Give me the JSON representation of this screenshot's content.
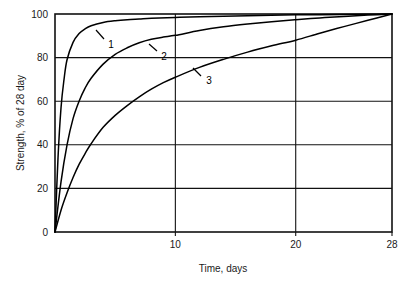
{
  "chart_data": {
    "type": "line",
    "title": "",
    "xlabel": "Time, days",
    "ylabel": "Strength, % of 28 day",
    "xlim": [
      0,
      28
    ],
    "ylim": [
      0,
      100
    ],
    "grid": true,
    "legend": "inline-curve-labels",
    "x_ticks": [
      {
        "value": 10,
        "label": "10"
      },
      {
        "value": 20,
        "label": "20"
      },
      {
        "value": 28,
        "label": "28"
      }
    ],
    "y_ticks": [
      {
        "value": 0,
        "label": "0"
      },
      {
        "value": 20,
        "label": "20"
      },
      {
        "value": 40,
        "label": "40"
      },
      {
        "value": 60,
        "label": "60"
      },
      {
        "value": 80,
        "label": "80"
      },
      {
        "value": 100,
        "label": "100"
      }
    ],
    "x_gridlines": [
      10,
      20
    ],
    "y_gridlines": [
      20,
      40,
      60,
      80
    ],
    "series": [
      {
        "name": "1",
        "label": "1",
        "x": [
          0,
          0.25,
          0.5,
          0.75,
          1,
          1.5,
          2,
          2.5,
          3,
          4,
          5,
          6,
          7,
          8,
          10,
          12,
          14,
          16,
          18,
          20,
          22,
          24,
          26,
          28
        ],
        "values": [
          0,
          34,
          57,
          70,
          79,
          87,
          91,
          93.2,
          94.6,
          96.1,
          96.9,
          97.4,
          97.7,
          98.0,
          98.4,
          98.7,
          99.0,
          99.2,
          99.4,
          99.6,
          99.7,
          99.8,
          99.9,
          100
        ]
      },
      {
        "name": "2",
        "label": "2",
        "x": [
          0,
          0.5,
          1,
          1.5,
          2,
          2.5,
          3,
          4,
          5,
          6,
          7,
          8,
          9,
          10,
          12,
          14,
          16,
          18,
          20,
          22,
          24,
          26,
          28
        ],
        "values": [
          0,
          23,
          40,
          52,
          60,
          66,
          70.5,
          77,
          81.5,
          84.5,
          86.8,
          88.4,
          89.4,
          90.2,
          92.4,
          94.1,
          95.4,
          96.5,
          97.4,
          98.2,
          98.9,
          99.5,
          100
        ]
      },
      {
        "name": "3",
        "label": "3",
        "x": [
          0,
          0.5,
          1,
          1.5,
          2,
          2.5,
          3,
          4,
          5,
          6,
          7,
          8,
          9,
          10,
          12,
          14,
          16,
          18,
          20,
          22,
          24,
          26,
          28
        ],
        "values": [
          0,
          10,
          18,
          25,
          31,
          36,
          40.5,
          48,
          53.5,
          58,
          62,
          65.5,
          68.5,
          71,
          75.5,
          79.2,
          82.5,
          85.4,
          88.0,
          91.2,
          94.2,
          97.1,
          100
        ]
      }
    ],
    "annotations": [
      {
        "label": "1",
        "label_x": 111,
        "label_y": 48,
        "leader_from_x": 104,
        "leader_from_y": 39,
        "leader_to_x": 96,
        "leader_to_y": 30
      },
      {
        "label": "2",
        "label_x": 164,
        "label_y": 60,
        "leader_from_x": 157,
        "leader_from_y": 51,
        "leader_to_x": 149,
        "leader_to_y": 44
      },
      {
        "label": "3",
        "label_x": 209,
        "label_y": 84,
        "leader_from_x": 201,
        "leader_from_y": 76,
        "leader_to_x": 193,
        "leader_to_y": 68
      }
    ],
    "colors": {
      "curve": "#000000",
      "grid": "#111111",
      "axis": "#111111",
      "background": "#ffffff",
      "text": "#1a1a1a"
    }
  }
}
